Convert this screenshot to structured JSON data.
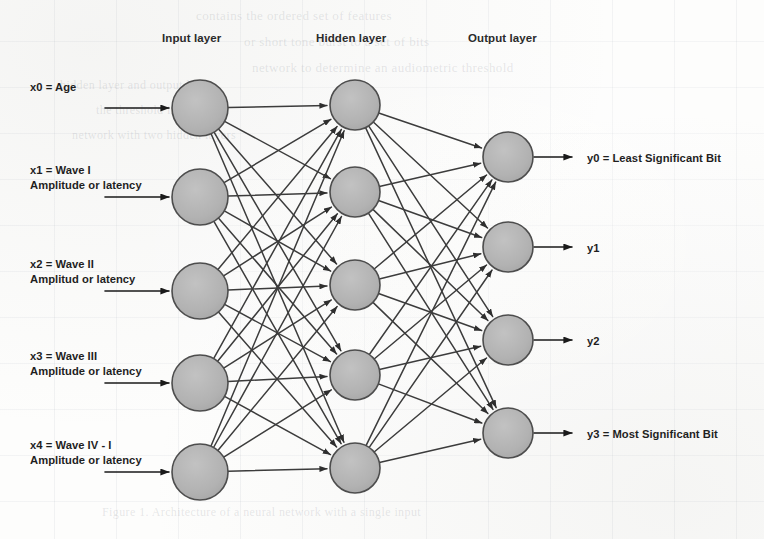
{
  "diagram": {
    "layer_titles": [
      {
        "name": "input-layer-title",
        "text": "Input layer",
        "x": 162,
        "y": 32
      },
      {
        "name": "hidden-layer-title",
        "text": "Hidden layer",
        "x": 316,
        "y": 32
      },
      {
        "name": "output-layer-title",
        "text": "Output layer",
        "x": 468,
        "y": 32
      }
    ],
    "colors": {
      "node_fill": "#b3b3b3",
      "node_stroke": "#4d4d4d",
      "edge": "#3c3c3c",
      "arrow": "#1a1a1a",
      "text": "#1f1f1f",
      "paper": "#fdfdfc"
    },
    "geometry": {
      "input_x": 200,
      "hidden_x": 355,
      "output_x": 508,
      "input_r": 28,
      "hidden_r": 25,
      "output_r": 25,
      "input_y": [
        108,
        197,
        291,
        383,
        472
      ],
      "hidden_y": [
        105,
        192,
        285,
        375,
        468
      ],
      "output_y": [
        157,
        247,
        340,
        433
      ],
      "in_arrow_start_x": 105,
      "out_arrow_end_x": 572
    },
    "inputs": [
      {
        "id": "x0",
        "line1": "x0 = Age",
        "line2": "",
        "label_x": 30,
        "label_y": 80,
        "arrow_y": 108
      },
      {
        "id": "x1",
        "line1": "x1 = Wave I",
        "line2": "Amplitude or latency",
        "label_x": 30,
        "label_y": 163,
        "arrow_y": 197
      },
      {
        "id": "x2",
        "line1": "x2 = Wave II",
        "line2": "Amplitud or latency",
        "label_x": 30,
        "label_y": 257,
        "arrow_y": 291
      },
      {
        "id": "x3",
        "line1": "x3 = Wave III",
        "line2": "Amplitude or latency",
        "label_x": 30,
        "label_y": 349,
        "arrow_y": 383
      },
      {
        "id": "x4",
        "line1": "x4 = Wave IV - I",
        "line2": "Amplitude or latency",
        "label_x": 30,
        "label_y": 438,
        "arrow_y": 472
      }
    ],
    "outputs": [
      {
        "id": "y0",
        "text": "y0 =  Least Significant Bit",
        "label_x": 587,
        "label_y": 151,
        "arrow_y": 157
      },
      {
        "id": "y1",
        "text": "y1",
        "label_x": 587,
        "label_y": 241,
        "arrow_y": 247
      },
      {
        "id": "y2",
        "text": "y2",
        "label_x": 587,
        "label_y": 334,
        "arrow_y": 340
      },
      {
        "id": "y3",
        "text": "y3 = Most Significant Bit",
        "label_x": 587,
        "label_y": 427,
        "arrow_y": 433
      }
    ],
    "bleed_text": [
      {
        "text": "contains the ordered set of features",
        "x": 196,
        "y": 8,
        "size": 13
      },
      {
        "text": "or short tone burst to a set of bits",
        "x": 244,
        "y": 34,
        "size": 13
      },
      {
        "text": "network to determine an audiometric threshold",
        "x": 252,
        "y": 60,
        "size": 13
      },
      {
        "text": "hidden layer and output layer",
        "x": 60,
        "y": 78,
        "size": 12
      },
      {
        "text": "the threshold in decibels",
        "x": 96,
        "y": 103,
        "size": 12
      },
      {
        "text": "network with two hidden layers",
        "x": 72,
        "y": 128,
        "size": 12
      },
      {
        "text": "Figure 1.  Architecture of a neural network with a single input",
        "x": 102,
        "y": 505,
        "size": 12
      }
    ]
  }
}
